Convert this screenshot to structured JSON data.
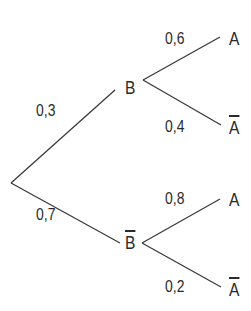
{
  "diagram": {
    "type": "probability-tree",
    "root": {
      "branches": [
        {
          "prob": "0,3",
          "node": "B",
          "negated": false,
          "branches": [
            {
              "prob": "0,6",
              "node": "A",
              "negated": false
            },
            {
              "prob": "0,4",
              "node": "A",
              "negated": true
            }
          ]
        },
        {
          "prob": "0,7",
          "node": "B",
          "negated": true,
          "branches": [
            {
              "prob": "0,8",
              "node": "A",
              "negated": false
            },
            {
              "prob": "0,2",
              "node": "A",
              "negated": true
            }
          ]
        }
      ]
    },
    "labels": {
      "p_B": "0,3",
      "p_notB": "0,7",
      "p_A_given_B": "0,6",
      "p_notA_given_B": "0,4",
      "p_A_given_notB": "0,8",
      "p_notA_given_notB": "0,2",
      "node_B": "B",
      "node_notB": "B",
      "leaf_1": "A",
      "leaf_2": "A",
      "leaf_3": "A",
      "leaf_4": "A"
    },
    "colors": {
      "line": "#3a3a3a",
      "text": "#2a2a2a",
      "background": "#ffffff"
    }
  }
}
